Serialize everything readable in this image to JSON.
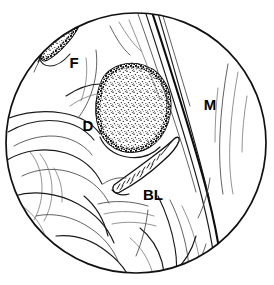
{
  "figure": {
    "type": "medical-line-drawing",
    "view": "circular endoscopic field of view",
    "background_color": "#ffffff",
    "ink_color": "#111111",
    "field": {
      "shape": "circle",
      "center_x": 136,
      "center_y": 143,
      "radius": 131
    },
    "labels": [
      {
        "key": "F",
        "text": "F",
        "x": 74,
        "y": 68,
        "description": "stippled elongated lesion at upper-left beneath the rim fold"
      },
      {
        "key": "D",
        "text": "D",
        "x": 88,
        "y": 131,
        "description": "large central irregular stippled lesion"
      },
      {
        "key": "BL",
        "text": "BL",
        "x": 146,
        "y": 200,
        "description": "hatched band structure in lower-central field"
      },
      {
        "key": "M",
        "text": "M",
        "x": 210,
        "y": 110,
        "description": "mucosal folds along the right side"
      }
    ],
    "regions": [
      {
        "name": "F-lesion",
        "kind": "stippled-patch",
        "fill": "stipple",
        "outline_color": "#000000",
        "location": "upper-left"
      },
      {
        "name": "D-lesion",
        "kind": "stippled-patch",
        "fill": "stipple",
        "outline_color": "#000000",
        "location": "center"
      },
      {
        "name": "BL-band",
        "kind": "hatched-band",
        "fill": "#ffffff",
        "outline_color": "#111111",
        "location": "lower-center"
      },
      {
        "name": "M-folds",
        "kind": "curved-line-bundle",
        "outline_color": "#1a1a1a",
        "location": "right"
      }
    ]
  }
}
